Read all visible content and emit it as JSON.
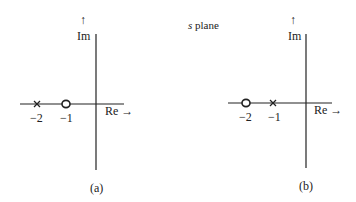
{
  "title": "s plane",
  "title_variable": "s",
  "title_word": "plane",
  "axes": {
    "real_label": "Re",
    "imag_label": "Im",
    "arrow_right": "→",
    "arrow_up": "↑"
  },
  "panels": [
    {
      "caption": "(a)",
      "points": [
        {
          "type": "pole",
          "symbol": "×",
          "value": -2,
          "label": "−2"
        },
        {
          "type": "zero",
          "symbol": "○",
          "value": -1,
          "label": "−1"
        }
      ]
    },
    {
      "caption": "(b)",
      "points": [
        {
          "type": "zero",
          "symbol": "○",
          "value": -2,
          "label": "−2"
        },
        {
          "type": "pole",
          "symbol": "×",
          "value": -1,
          "label": "−1"
        }
      ]
    }
  ]
}
